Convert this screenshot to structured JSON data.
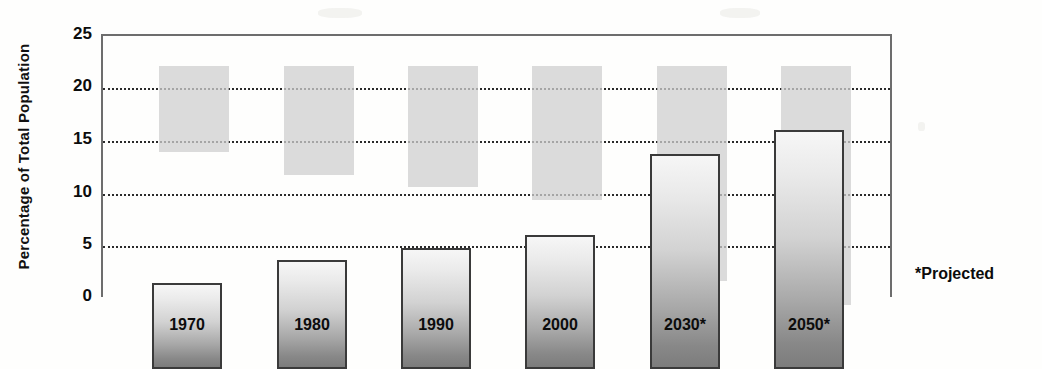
{
  "chart_data": {
    "type": "bar",
    "title": "",
    "xlabel": "",
    "ylabel": "Percentage of Total Population",
    "categories": [
      "1970",
      "1980",
      "1990",
      "2000",
      "2030*",
      "2050*"
    ],
    "values": [
      8.2,
      10.4,
      11.5,
      12.7,
      20.4,
      22.7
    ],
    "ylim": [
      0,
      25
    ],
    "yticks": [
      0,
      5,
      10,
      15,
      20,
      25
    ],
    "ytick_labels": [
      "0",
      "5",
      "10",
      "15",
      "20",
      "25"
    ],
    "grid": true,
    "gridlines_at": [
      5,
      10,
      15,
      20
    ],
    "legend": "none",
    "annotations": [
      "*Projected"
    ],
    "series": [
      {
        "name": "Percentage of Total Population",
        "values": [
          8.2,
          10.4,
          11.5,
          12.7,
          20.4,
          22.7
        ]
      }
    ]
  },
  "axis": {
    "y_title": "Percentage of Total Population",
    "ticks": [
      {
        "label": "25",
        "value": 25
      },
      {
        "label": "20",
        "value": 20
      },
      {
        "label": "15",
        "value": 15
      },
      {
        "label": "10",
        "value": 10
      },
      {
        "label": "5",
        "value": 5
      },
      {
        "label": "0",
        "value": 0
      }
    ]
  },
  "bars": [
    {
      "label": "1970",
      "value": 8.2
    },
    {
      "label": "1980",
      "value": 10.4
    },
    {
      "label": "1990",
      "value": 11.5
    },
    {
      "label": "2000",
      "value": 12.7
    },
    {
      "label": "2030*",
      "value": 20.4
    },
    {
      "label": "2050*",
      "value": 22.7
    }
  ],
  "footnote": {
    "text": "*Projected"
  },
  "colors": {
    "bar_top": "#f6f6f6",
    "bar_bottom": "#7c7c7c",
    "bar_border": "#3a3a3a",
    "bar_shadow": "#cfcfcf",
    "gridline": "#2a2a2a",
    "axis": "#6d6d6d",
    "text": "#0c0c0c",
    "background": "#fefefd"
  }
}
